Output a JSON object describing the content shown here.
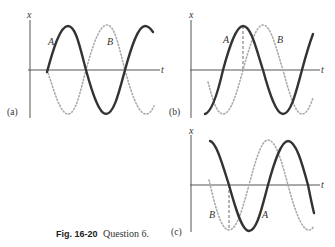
{
  "figure": {
    "caption_label": "Fig. 16-20",
    "caption_text": "Question 6.",
    "panels": [
      {
        "id": "a",
        "label": "(a)",
        "x_axis": "t",
        "y_axis": "x",
        "curve_labels": [
          "A",
          "B"
        ]
      },
      {
        "id": "b",
        "label": "(b)",
        "x_axis": "t",
        "y_axis": "x",
        "curve_labels": [
          "A",
          "B"
        ]
      },
      {
        "id": "c",
        "label": "(c)",
        "x_axis": "t",
        "y_axis": "x",
        "curve_labels": [
          "B",
          "A"
        ]
      }
    ]
  },
  "colors": {
    "curve_A": "#333333",
    "curve_B": "#aaaaaa",
    "axes": "#555555"
  }
}
